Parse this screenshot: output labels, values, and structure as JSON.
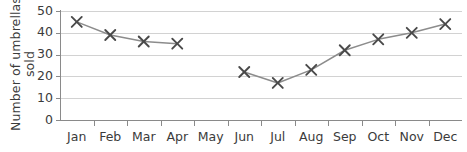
{
  "chart_data": {
    "type": "line",
    "title": "",
    "xlabel": "",
    "ylabel": "Number of umbrellas sold",
    "ylabel_line1": "Number of umbrellas",
    "ylabel_line2": "sold",
    "categories": [
      "Jan",
      "Feb",
      "Mar",
      "Apr",
      "May",
      "Jun",
      "Jul",
      "Aug",
      "Sep",
      "Oct",
      "Nov",
      "Dec"
    ],
    "values": [
      45,
      39,
      36,
      35,
      null,
      22,
      17,
      23,
      32,
      37,
      40,
      44
    ],
    "series": [
      {
        "name": "Number of umbrellas sold",
        "values": [
          45,
          39,
          36,
          35,
          null,
          22,
          17,
          23,
          32,
          37,
          40,
          44
        ]
      }
    ],
    "ylim": [
      0,
      50
    ],
    "yticks": [
      0,
      10,
      20,
      30,
      40,
      50
    ],
    "ytick_labels": [
      "0",
      "10",
      "20",
      "30",
      "40",
      "50"
    ],
    "grid": true,
    "grid_axis": "y",
    "legend": false,
    "legend_position": "none",
    "marker": "x",
    "missing_categories": [
      "May"
    ],
    "annotations": [],
    "colors": {
      "line": "#8c8c8c",
      "marker": "#4a4a4a",
      "grid": "#d2d2d2",
      "axis": "#8a8a8a",
      "text": "#3b3b3b",
      "background": "#ffffff"
    }
  }
}
